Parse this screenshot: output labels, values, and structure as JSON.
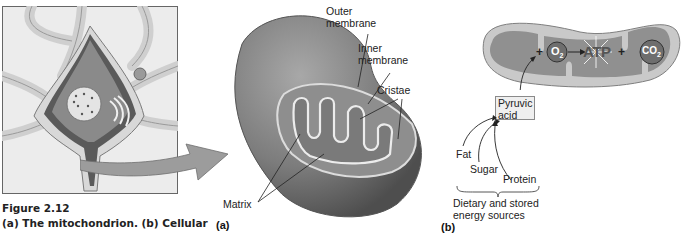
{
  "figure": {
    "number": "Figure 2.12",
    "caption_line": "(a) The mitochondrion. (b) Cellular"
  },
  "panel_a": {
    "tag": "(a)",
    "labels": {
      "outer_membrane": [
        "Outer",
        "membrane"
      ],
      "inner_membrane": [
        "Inner",
        "membrane"
      ],
      "cristae": "Cristae",
      "matrix": "Matrix"
    }
  },
  "panel_b": {
    "tag": "(b)",
    "equation": {
      "plus1": "+",
      "o2": "O",
      "o2_sub": "2",
      "atp": "ATP",
      "plus2": "+",
      "co2": "CO",
      "co2_sub": "2"
    },
    "pyruvic_box": [
      "Pyruvic",
      "acid"
    ],
    "sources": [
      "Fat",
      "Sugar",
      "Protein"
    ],
    "brace_label": [
      "Dietary and stored",
      "energy sources"
    ]
  },
  "colors": {
    "mito_outer": "#bdbdbd",
    "mito_inner": "#8c8c8c",
    "membrane_line": "#e8e8e8",
    "text": "#222222"
  }
}
